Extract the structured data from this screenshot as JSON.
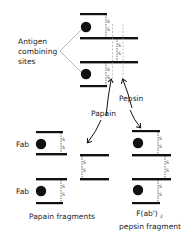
{
  "diagram": {
    "labels": {
      "antigen_sites_line1": "Antigen",
      "antigen_sites_line2": "combining",
      "antigen_sites_line3": "sites",
      "papain": "Papain",
      "pepsin": "Pepsin",
      "fab_top": "Fab",
      "fab_bottom": "Fab",
      "papain_fragments": "Papain fragments",
      "fab2_main": "F(ab')",
      "fab2_sub": "2",
      "pepsin_fragment": "pepsin fragment",
      "disulfide": "S"
    },
    "colors": {
      "ink": "#111111",
      "dash": "#999999",
      "text": "#222222"
    }
  }
}
